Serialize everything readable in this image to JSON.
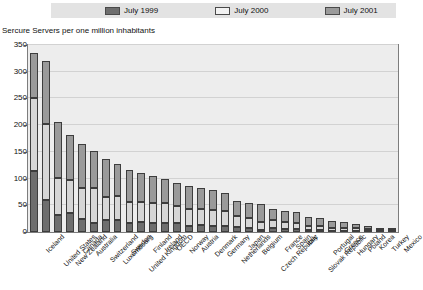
{
  "legend": {
    "items": [
      {
        "label": "July 1999",
        "color": "#6e6e6e",
        "icon": "legend-swatch-icon"
      },
      {
        "label": "July 2000",
        "color": "#d6d6d6",
        "icon": "legend-swatch-icon"
      },
      {
        "label": "July 2001",
        "color": "#9a9a9a",
        "icon": "legend-swatch-icon"
      }
    ]
  },
  "axis_title": "Sercure Servers per one million inhabitants",
  "chart_data": {
    "type": "bar",
    "stacked": true,
    "title": "Sercure Servers per one million inhabitants",
    "xlabel": "",
    "ylabel": "",
    "ylim": [
      0,
      350
    ],
    "ytick_step": 50,
    "yticks": [
      0,
      50,
      100,
      150,
      200,
      250,
      300,
      350
    ],
    "grid": true,
    "legend_position": "top",
    "categories": [
      "Iceland",
      "United States",
      "New Zealand",
      "Canada",
      "Australia",
      "Switzerland",
      "Luxembourg",
      "Sweden",
      "United Kingdom",
      "Finland",
      "Ireland",
      "OECD",
      "Norway",
      "Austria",
      "Denmark",
      "Germany",
      "Netherlands",
      "Japan",
      "Belgium",
      "Czech Republic",
      "France",
      "Spain",
      "Italy",
      "Slovak Republic",
      "Portugal",
      "Greece",
      "Hungary",
      "Poland",
      "Korea",
      "Turkey",
      "Mexico"
    ],
    "series": [
      {
        "name": "July 1999",
        "color": "#6e6e6e",
        "values": [
          115,
          60,
          32,
          35,
          25,
          17,
          23,
          23,
          17,
          18,
          17,
          17,
          16,
          12,
          13,
          12,
          12,
          9,
          8,
          4,
          7,
          6,
          5,
          3,
          3,
          2,
          2,
          2,
          2,
          1,
          1
        ]
      },
      {
        "name": "July 2000",
        "color": "#d6d6d6",
        "values": [
          135,
          143,
          70,
          63,
          58,
          66,
          42,
          45,
          40,
          39,
          38,
          38,
          32,
          32,
          30,
          29,
          27,
          21,
          18,
          14,
          15,
          12,
          11,
          9,
          9,
          6,
          6,
          5,
          4,
          3,
          3
        ]
      },
      {
        "name": "July 2001",
        "color": "#9a9a9a",
        "values": [
          85,
          117,
          103,
          84,
          81,
          69,
          72,
          59,
          59,
          54,
          50,
          45,
          44,
          42,
          39,
          37,
          34,
          29,
          29,
          34,
          22,
          22,
          21,
          17,
          14,
          12,
          10,
          8,
          6,
          4,
          3
        ]
      }
    ],
    "totals": [
      335,
      320,
      205,
      182,
      164,
      152,
      137,
      127,
      116,
      111,
      105,
      100,
      92,
      86,
      82,
      78,
      73,
      59,
      55,
      52,
      44,
      40,
      37,
      29,
      26,
      20,
      18,
      15,
      12,
      8,
      7
    ]
  }
}
